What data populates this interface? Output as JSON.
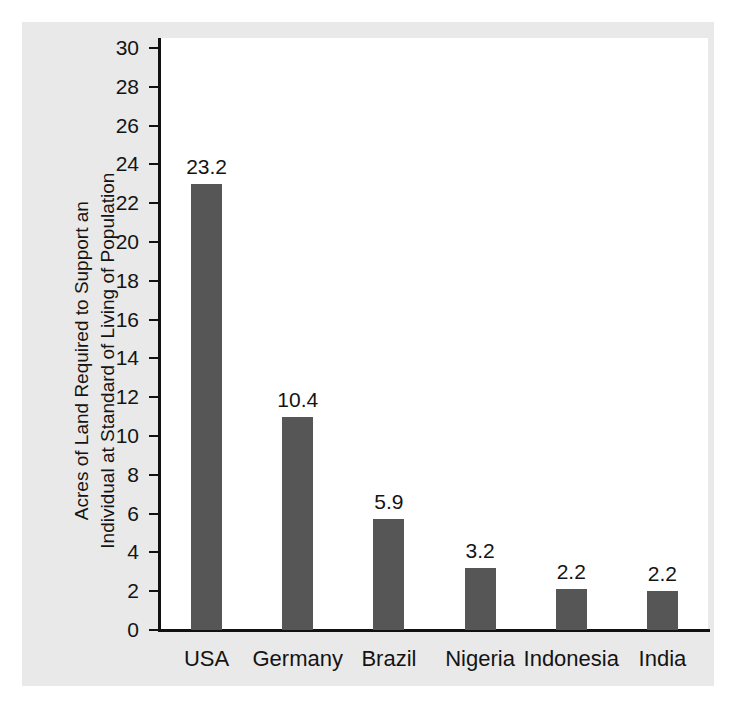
{
  "chart_data": {
    "type": "bar",
    "title": "",
    "xlabel": "",
    "ylabel_line1": "Acres of Land Required to Support an",
    "ylabel_line2": "Individual at Standard of Living of Population",
    "categories": [
      "USA",
      "Germany",
      "Brazil",
      "Nigeria",
      "Indonesia",
      "India"
    ],
    "values": [
      23.2,
      10.4,
      5.9,
      3.2,
      2.2,
      2.2
    ],
    "value_labels": [
      "23.2",
      "10.4",
      "5.9",
      "3.2",
      "2.2",
      "2.2"
    ],
    "bar_heights_drawn": [
      23.0,
      11.0,
      5.7,
      3.2,
      2.1,
      2.0
    ],
    "ylim": [
      0,
      30
    ],
    "ytick_step": 2,
    "ytick_labels": [
      "30",
      "28",
      "26",
      "24",
      "22",
      "20",
      "18",
      "16",
      "14",
      "12",
      "10",
      "8",
      "6",
      "4",
      "2",
      "0"
    ],
    "ytick_values": [
      30,
      28,
      26,
      24,
      22,
      20,
      18,
      16,
      14,
      12,
      10,
      8,
      6,
      4,
      2,
      0
    ],
    "grid": false,
    "legend": "none",
    "bar_color": "#565656",
    "axis_color": "#111111",
    "plot_background": "#ffffff",
    "figure_background": "#e9e9e9"
  }
}
